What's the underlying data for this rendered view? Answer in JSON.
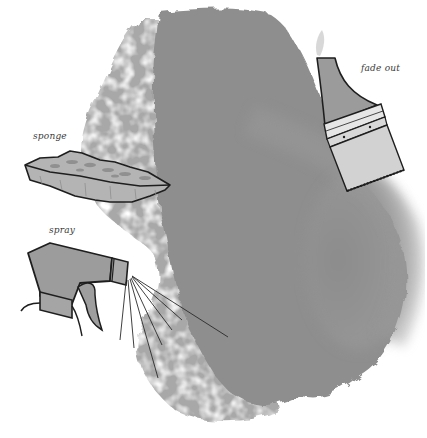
{
  "illustration": {
    "subject": "watercolor wash techniques",
    "labels": {
      "sponge": "sponge",
      "spray": "spray",
      "fade_out": "fade out"
    },
    "tools": [
      {
        "name": "sponge",
        "label": "sponge"
      },
      {
        "name": "spray bottle",
        "label": "spray"
      },
      {
        "name": "flat paintbrush",
        "label": "fade out"
      }
    ],
    "colors": {
      "background": "#ffffff",
      "wash_dark": "#8a8a8a",
      "wash_mid": "#a3a3a3",
      "wash_light": "#c4c4c4",
      "ink_line": "#1e1e1e",
      "tool_fill": "#9e9e9e"
    }
  }
}
